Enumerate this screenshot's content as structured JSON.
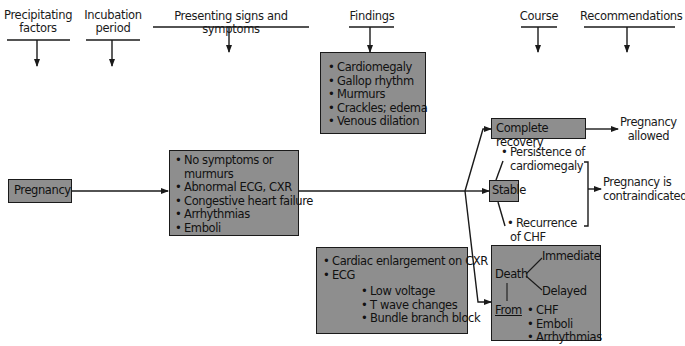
{
  "headers": {
    "precipitating": "Precipitating factors",
    "precipitating_l1": "Precipitating",
    "precipitating_l2": "factors",
    "incubation_l1": "Incubation",
    "incubation_l2": "period",
    "presenting": "Presenting signs and symptoms",
    "findings": "Findings",
    "course": "Course",
    "recommendations": "Recommendations"
  },
  "precipitating_box": {
    "label": "Pregnancy"
  },
  "presenting_box": {
    "items": [
      "No symptoms or",
      "murmurs",
      "Abnormal ECG, CXR",
      "Congestive heart failure",
      "Arrhythmias",
      "Emboli"
    ]
  },
  "findings_box": {
    "items": [
      "Cardiomegaly",
      "Gallop rhythm",
      "Murmurs",
      "Crackles; edema",
      "Venous dilation"
    ]
  },
  "findings_box_2": {
    "items": [
      "Cardiac enlargement on CXR",
      "ECG"
    ],
    "ecg_items": [
      "Low voltage",
      "T wave changes",
      "Bundle branch block"
    ]
  },
  "course": {
    "complete_recovery": "Complete recovery",
    "stable": "Stable",
    "persistence_l1": "Persistence of",
    "persistence_l2": "cardiomegaly",
    "recurrence_l1": "Recurrence",
    "recurrence_l2": "of CHF",
    "death_box": {
      "death": "Death",
      "immediate": "Immediate",
      "delayed": "Delayed",
      "from": "From",
      "causes": [
        "CHF",
        "Emboli",
        "Arrhythmias"
      ]
    }
  },
  "recommendations": {
    "allowed_l1": "Pregnancy",
    "allowed_l2": "allowed",
    "contra_l1": "Pregnancy is",
    "contra_l2": "contraindicated"
  },
  "colors": {
    "box_fill": "#8e8e8e",
    "line": "#1a1a1a",
    "background": "#ffffff"
  }
}
